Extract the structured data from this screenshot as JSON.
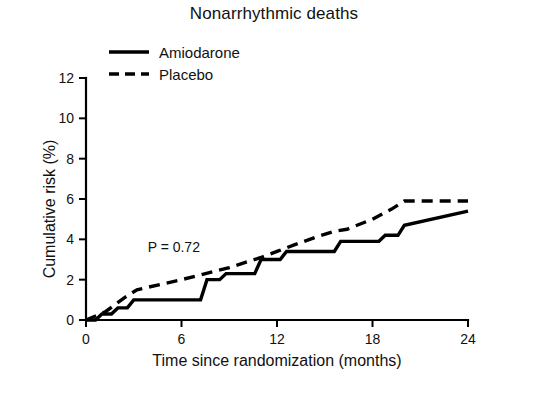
{
  "chart_data": {
    "type": "line",
    "title": "Nonarrhythmic deaths",
    "xlabel": "Time since randomization (months)",
    "ylabel": "Cumulative risk (%)",
    "xlim": [
      0,
      24
    ],
    "ylim": [
      0,
      12
    ],
    "xticks": [
      0,
      6,
      12,
      18,
      24
    ],
    "xtick_labels": [
      "0",
      "6",
      "12",
      "18",
      "24"
    ],
    "yticks": [
      0,
      2,
      4,
      6,
      8,
      10,
      12
    ],
    "ytick_labels": [
      "0",
      "2",
      "4",
      "6",
      "8",
      "10",
      "12"
    ],
    "grid": false,
    "legend_position": "top-left",
    "annotations": [
      {
        "name": "p-value",
        "text": "P = 0.72",
        "x": 4.0,
        "y": 3.6
      }
    ],
    "series": [
      {
        "name": "Amiodarone",
        "style": "solid",
        "x": [
          0.0,
          0.6,
          1.0,
          1.6,
          2.0,
          2.6,
          3.0,
          4.6,
          5.0,
          7.2,
          7.6,
          8.4,
          8.8,
          10.6,
          11.0,
          12.2,
          12.6,
          15.6,
          16.0,
          18.4,
          18.8,
          19.6,
          20.0,
          24.0
        ],
        "y": [
          0.0,
          0.0,
          0.3,
          0.3,
          0.6,
          0.6,
          1.0,
          1.0,
          1.0,
          1.0,
          2.0,
          2.0,
          2.3,
          2.3,
          3.0,
          3.0,
          3.4,
          3.4,
          3.9,
          3.9,
          4.2,
          4.2,
          4.7,
          5.4
        ],
        "points": [
          {
            "x": 0,
            "y": 0.0
          },
          {
            "x": 3,
            "y": 1.0
          },
          {
            "x": 6,
            "y": 1.0
          },
          {
            "x": 8,
            "y": 2.2
          },
          {
            "x": 11,
            "y": 3.0
          },
          {
            "x": 12,
            "y": 3.4
          },
          {
            "x": 16,
            "y": 3.9
          },
          {
            "x": 19,
            "y": 4.2
          },
          {
            "x": 20,
            "y": 4.7
          },
          {
            "x": 24,
            "y": 5.4
          }
        ]
      },
      {
        "name": "Placebo",
        "style": "dashed",
        "x": [
          0.0,
          1.2,
          2.4,
          3.2,
          6.0,
          8.0,
          9.0,
          11.0,
          12.0,
          13.0,
          14.4,
          15.6,
          16.4,
          18.0,
          19.2,
          20.0,
          21.0,
          24.0
        ],
        "y": [
          0.0,
          0.4,
          1.1,
          1.5,
          2.0,
          2.4,
          2.6,
          3.1,
          3.4,
          3.7,
          4.1,
          4.4,
          4.5,
          5.0,
          5.5,
          5.9,
          5.9,
          5.9
        ],
        "points": [
          {
            "x": 0,
            "y": 0.0
          },
          {
            "x": 3,
            "y": 1.4
          },
          {
            "x": 6,
            "y": 2.0
          },
          {
            "x": 9,
            "y": 2.6
          },
          {
            "x": 12,
            "y": 3.4
          },
          {
            "x": 15,
            "y": 4.3
          },
          {
            "x": 18,
            "y": 5.0
          },
          {
            "x": 20,
            "y": 5.9
          },
          {
            "x": 24,
            "y": 5.9
          }
        ]
      }
    ]
  },
  "title": "Nonarrhythmic deaths",
  "legend": {
    "items": [
      {
        "label": "Amiodarone",
        "style": "solid"
      },
      {
        "label": "Placebo",
        "style": "dashed"
      }
    ]
  },
  "axes": {
    "x_title": "Time since randomization (months)",
    "y_title": "Cumulative risk (%)",
    "x_labels": [
      "0",
      "6",
      "12",
      "18",
      "24"
    ],
    "y_labels": [
      "12",
      "10",
      "8",
      "6",
      "4",
      "2",
      "0"
    ]
  },
  "annotation": {
    "p_value": "P = 0.72"
  },
  "colors": {
    "foreground": "#000000",
    "background": "#ffffff"
  }
}
